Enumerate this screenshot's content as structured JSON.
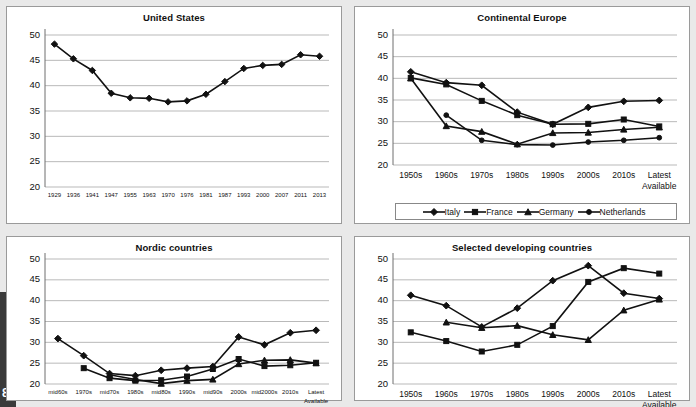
{
  "page": {
    "edge_number": "8",
    "background": "#e9e9e9",
    "ink": "#111111",
    "gridline": "#b9b9b9"
  },
  "panels": [
    {
      "id": "united-states",
      "title": "United States"
    },
    {
      "id": "continental-europe",
      "title": "Continental Europe"
    },
    {
      "id": "nordic-countries",
      "title": "Nordic countries"
    },
    {
      "id": "selected-developing-countries",
      "title": "Selected developing countries"
    }
  ],
  "legend": {
    "items": [
      {
        "label": "Italy",
        "marker": "diamond"
      },
      {
        "label": "France",
        "marker": "square"
      },
      {
        "label": "Germany",
        "marker": "triangle"
      },
      {
        "label": "Netherlands",
        "marker": "circle"
      }
    ]
  },
  "chart_data": [
    {
      "type": "line",
      "title": "United States",
      "xlabel": "",
      "ylabel": "",
      "ylim": [
        20,
        50
      ],
      "yticks": [
        20,
        25,
        30,
        35,
        40,
        45,
        50
      ],
      "grid": true,
      "legend_position": "none",
      "categories": [
        "1929",
        "1936",
        "1941",
        "1947",
        "1955",
        "1963",
        "1970",
        "1976",
        "1981",
        "1987",
        "1993",
        "2000",
        "2007",
        "2011",
        "2013"
      ],
      "series": [
        {
          "name": "United States",
          "marker": "diamond",
          "values": [
            48.2,
            45.3,
            43.0,
            38.5,
            37.6,
            37.5,
            36.8,
            37.0,
            38.3,
            40.8,
            43.4,
            44.0,
            44.2,
            46.1,
            45.8
          ]
        }
      ]
    },
    {
      "type": "line",
      "title": "Continental Europe",
      "xlabel": "",
      "ylabel": "",
      "ylim": [
        20,
        50
      ],
      "yticks": [
        20,
        25,
        30,
        35,
        40,
        45,
        50
      ],
      "grid": true,
      "legend_position": "bottom",
      "categories": [
        "1950s",
        "1960s",
        "1970s",
        "1980s",
        "1990s",
        "2000s",
        "2010s",
        "Latest Available"
      ],
      "series": [
        {
          "name": "Italy",
          "marker": "diamond",
          "values": [
            41.5,
            39.0,
            38.4,
            32.2,
            29.4,
            33.3,
            34.7,
            34.9
          ]
        },
        {
          "name": "France",
          "marker": "square",
          "values": [
            40.1,
            38.6,
            34.8,
            31.5,
            29.4,
            29.5,
            30.5,
            28.9
          ]
        },
        {
          "name": "Germany",
          "marker": "triangle",
          "values": [
            40.0,
            29.0,
            27.7,
            24.8,
            27.4,
            27.5,
            28.2,
            28.7
          ]
        },
        {
          "name": "Netherlands",
          "marker": "circle",
          "values": [
            null,
            31.5,
            25.7,
            24.7,
            24.6,
            25.3,
            25.7,
            26.3
          ]
        }
      ]
    },
    {
      "type": "line",
      "title": "Nordic countries",
      "xlabel": "",
      "ylabel": "",
      "ylim": [
        20,
        50
      ],
      "yticks": [
        20,
        25,
        30,
        35,
        40,
        45,
        50
      ],
      "grid": true,
      "legend_position": "none",
      "categories": [
        "mid60s",
        "1970s",
        "mid70s",
        "1980s",
        "mid80s",
        "1990s",
        "mid90s",
        "2000s",
        "mid2000s",
        "2010s",
        "Latest Available"
      ],
      "series": [
        {
          "name": "series-1",
          "marker": "diamond",
          "values": [
            30.9,
            26.8,
            22.5,
            22.0,
            23.3,
            23.8,
            24.2,
            31.3,
            29.4,
            32.3,
            32.9
          ]
        },
        {
          "name": "series-2",
          "marker": "square",
          "values": [
            null,
            23.8,
            21.4,
            20.8,
            20.9,
            21.8,
            23.6,
            26.0,
            24.3,
            24.5,
            25.1
          ]
        },
        {
          "name": "series-3",
          "marker": "triangle",
          "values": [
            null,
            null,
            22.2,
            21.1,
            20.1,
            20.8,
            21.1,
            24.8,
            25.7,
            25.8,
            25.0
          ]
        }
      ]
    },
    {
      "type": "line",
      "title": "Selected developing countries",
      "xlabel": "",
      "ylabel": "",
      "ylim": [
        20,
        50
      ],
      "yticks": [
        20,
        25,
        30,
        35,
        40,
        45,
        50
      ],
      "grid": true,
      "legend_position": "none",
      "categories": [
        "1950s",
        "1960s",
        "1970s",
        "1980s",
        "1990s",
        "2000s",
        "2010s",
        "Latest Available"
      ],
      "series": [
        {
          "name": "series-1",
          "marker": "diamond",
          "values": [
            41.3,
            38.8,
            33.7,
            38.2,
            44.8,
            48.4,
            41.8,
            40.5
          ]
        },
        {
          "name": "series-2",
          "marker": "square",
          "values": [
            32.4,
            30.3,
            27.8,
            29.4,
            33.9,
            44.5,
            47.8,
            46.5
          ]
        },
        {
          "name": "series-3",
          "marker": "triangle",
          "values": [
            null,
            34.8,
            33.5,
            34.0,
            31.8,
            30.6,
            37.7,
            40.3
          ]
        }
      ]
    }
  ]
}
